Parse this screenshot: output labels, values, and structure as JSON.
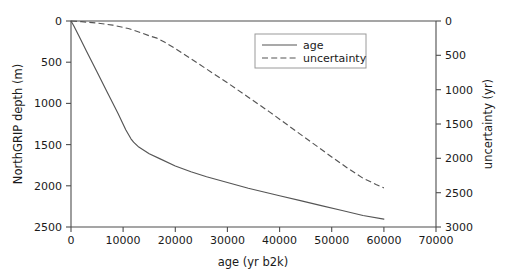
{
  "chart_data": {
    "type": "line",
    "title": "",
    "xlabel": "age (yr b2k)",
    "ylabel": "NorthGRIP depth (m)",
    "y2label": "uncertainty (yr)",
    "xlim": [
      0,
      70000
    ],
    "ylim": [
      2500,
      0
    ],
    "y2lim": [
      3000,
      0
    ],
    "xticks": [
      0,
      10000,
      20000,
      30000,
      40000,
      50000,
      60000,
      70000
    ],
    "xticklabels": [
      "0",
      "10000",
      "20000",
      "30000",
      "40000",
      "50000",
      "60000",
      "70000"
    ],
    "yticks": [
      0,
      500,
      1000,
      1500,
      2000,
      2500
    ],
    "yticklabels": [
      "0",
      "500",
      "1000",
      "1500",
      "2000",
      "2500"
    ],
    "y2ticks": [
      0,
      500,
      1000,
      1500,
      2000,
      2500,
      3000
    ],
    "y2ticklabels": [
      "0",
      "500",
      "1000",
      "1500",
      "2000",
      "2500",
      "3000"
    ],
    "grid": false,
    "legend_position": "upper center",
    "series": [
      {
        "name": "age",
        "axis": "left",
        "style": "solid",
        "color": "#555555",
        "x": [
          0,
          500,
          1500,
          3000,
          5000,
          7000,
          9000,
          10500,
          11500,
          12000,
          13000,
          15000,
          17000,
          20000,
          23000,
          26000,
          30000,
          34000,
          38000,
          40000,
          44000,
          48000,
          52000,
          56000,
          60000
        ],
        "y": [
          0,
          55,
          180,
          370,
          620,
          870,
          1120,
          1320,
          1430,
          1470,
          1530,
          1610,
          1670,
          1760,
          1830,
          1890,
          1960,
          2030,
          2090,
          2120,
          2180,
          2240,
          2300,
          2360,
          2405
        ]
      },
      {
        "name": "uncertainty",
        "axis": "right",
        "style": "dashed",
        "color": "#555555",
        "x": [
          0,
          2000,
          5000,
          8000,
          11000,
          13000,
          15000,
          16500,
          18000,
          20000,
          23000,
          26000,
          30000,
          34000,
          38000,
          42000,
          46000,
          50000,
          53000,
          56000,
          58500,
          60000
        ],
        "y": [
          0,
          10,
          30,
          60,
          110,
          160,
          215,
          250,
          310,
          400,
          550,
          700,
          900,
          1110,
          1320,
          1540,
          1760,
          1980,
          2140,
          2290,
          2380,
          2430
        ]
      }
    ],
    "legend_entries": [
      {
        "label": "age",
        "style": "solid"
      },
      {
        "label": "uncertainty",
        "style": "dashed"
      }
    ]
  }
}
